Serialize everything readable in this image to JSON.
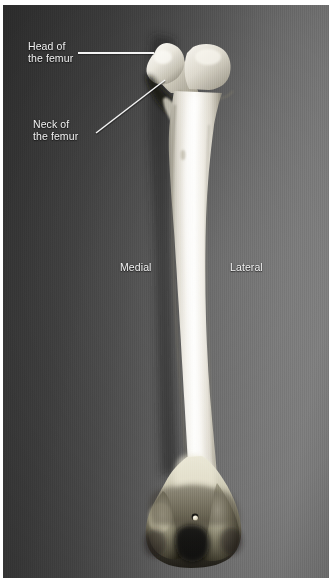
{
  "figure": {
    "kind": "anatomical-photograph",
    "view": "posterior view of right femur"
  },
  "labels": [
    {
      "id": "head",
      "name": "label-head-of-the-femur",
      "line1": "Head of",
      "line2": "the femur",
      "text": "Head of\nthe femur",
      "color": "#f2f2f2"
    },
    {
      "id": "neck",
      "name": "label-neck-of-the-femur",
      "line1": "Neck of",
      "line2": "the femur",
      "text": "Neck of\nthe femur",
      "color": "#f2f2f2"
    },
    {
      "id": "medial",
      "name": "label-medial",
      "line1": "Medial",
      "line2": "",
      "text": "Medial",
      "color": "#f2f2f2"
    },
    {
      "id": "lateral",
      "name": "label-lateral",
      "line1": "Lateral",
      "line2": "",
      "text": "Lateral",
      "color": "#f2f2f2"
    }
  ],
  "leader_lines": [
    {
      "id": "head-leader",
      "name": "leader-line-head",
      "style": "horizontal",
      "from": [
        75,
        48
      ],
      "to": [
        151,
        48
      ],
      "color": "#f4f4f4"
    },
    {
      "id": "neck-leader",
      "name": "leader-line-neck",
      "style": "diagonal",
      "from": [
        95,
        130
      ],
      "to": [
        164,
        77
      ],
      "color": "#f4f4f4"
    }
  ],
  "colors": {
    "background_dark": "#2f2f2f",
    "background_light": "#7c7c7c",
    "bone_highlight": "#fafafa",
    "bone_base": "#e6e3dc",
    "bone_shadow": "#8d8878",
    "condyle_shadow": "#1b1915",
    "label_text": "#f2f2f2",
    "leader_line": "#f4f4f4",
    "page": "#ffffff"
  },
  "anatomy_parts": [
    "head of the femur",
    "neck of the femur",
    "greater trochanter",
    "lesser trochanter",
    "shaft (body) of the femur",
    "medial condyle",
    "lateral condyle",
    "intercondylar fossa"
  ],
  "plate": {
    "left": 3,
    "top": 5,
    "width": 326,
    "height": 573
  }
}
